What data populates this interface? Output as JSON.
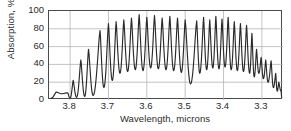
{
  "chart_data": {
    "type": "line",
    "title": "",
    "xlabel": "Wavelength, microns",
    "ylabel": "Absorption, %",
    "xticks": [
      "3.8",
      "3.7",
      "3.6",
      "3.5",
      "3.4",
      "3.3"
    ],
    "xtick_values": [
      3.8,
      3.7,
      3.6,
      3.5,
      3.4,
      3.3
    ],
    "yticks": [
      "0",
      "20",
      "40",
      "60",
      "80",
      "100"
    ],
    "ytick_values": [
      0,
      20,
      40,
      60,
      80,
      100
    ],
    "xlim": [
      3.855,
      3.245
    ],
    "ylim": [
      0,
      100
    ],
    "x_axis_reversed": true,
    "grid": true,
    "grid_color": "#b4b4b4",
    "line_color": "#2a2a2a",
    "frame_color": "#4a4a4a",
    "legend": null,
    "series": [
      {
        "name": "Absorption spectrum",
        "x": [
          3.855,
          3.848,
          3.842,
          3.836,
          3.83,
          3.824,
          3.818,
          3.812,
          3.806,
          3.8,
          3.794,
          3.788,
          3.782,
          3.776,
          3.77,
          3.764,
          3.758,
          3.752,
          3.746,
          3.74,
          3.734,
          3.728,
          3.722,
          3.716,
          3.71,
          3.704,
          3.698,
          3.692,
          3.686,
          3.68,
          3.674,
          3.668,
          3.662,
          3.656,
          3.65,
          3.644,
          3.638,
          3.632,
          3.626,
          3.62,
          3.614,
          3.608,
          3.602,
          3.596,
          3.59,
          3.584,
          3.578,
          3.572,
          3.566,
          3.56,
          3.554,
          3.548,
          3.542,
          3.536,
          3.53,
          3.524,
          3.518,
          3.512,
          3.506,
          3.5,
          3.494,
          3.488,
          3.482,
          3.476,
          3.47,
          3.464,
          3.458,
          3.452,
          3.446,
          3.44,
          3.434,
          3.428,
          3.422,
          3.416,
          3.41,
          3.404,
          3.398,
          3.392,
          3.386,
          3.38,
          3.374,
          3.368,
          3.362,
          3.356,
          3.35,
          3.344,
          3.338,
          3.332,
          3.326,
          3.32,
          3.314,
          3.308,
          3.302,
          3.296,
          3.29,
          3.284,
          3.278,
          3.272,
          3.266,
          3.26,
          3.254,
          3.248
        ],
        "comment": "Dense rovibrational absorption comb; peak envelope rises from ~8% at 3.85, saturates near 90-96% between 3.62 and 3.33, then decays to ~10% by 3.25",
        "peaks": [
          {
            "x": 3.836,
            "y": 9
          },
          {
            "x": 3.82,
            "y": 7
          },
          {
            "x": 3.806,
            "y": 8
          },
          {
            "x": 3.792,
            "y": 22
          },
          {
            "x": 3.772,
            "y": 45
          },
          {
            "x": 3.752,
            "y": 57
          },
          {
            "x": 3.722,
            "y": 78
          },
          {
            "x": 3.7,
            "y": 86
          },
          {
            "x": 3.68,
            "y": 88
          },
          {
            "x": 3.66,
            "y": 90
          },
          {
            "x": 3.64,
            "y": 92
          },
          {
            "x": 3.62,
            "y": 96
          },
          {
            "x": 3.6,
            "y": 93
          },
          {
            "x": 3.58,
            "y": 95
          },
          {
            "x": 3.56,
            "y": 92
          },
          {
            "x": 3.54,
            "y": 94
          },
          {
            "x": 3.52,
            "y": 92
          },
          {
            "x": 3.5,
            "y": 90
          },
          {
            "x": 3.47,
            "y": 89
          },
          {
            "x": 3.452,
            "y": 93
          },
          {
            "x": 3.436,
            "y": 90
          },
          {
            "x": 3.42,
            "y": 94
          },
          {
            "x": 3.404,
            "y": 91
          },
          {
            "x": 3.388,
            "y": 93
          },
          {
            "x": 3.372,
            "y": 88
          },
          {
            "x": 3.356,
            "y": 86
          },
          {
            "x": 3.34,
            "y": 84
          },
          {
            "x": 3.326,
            "y": 75
          },
          {
            "x": 3.314,
            "y": 57
          },
          {
            "x": 3.302,
            "y": 48
          },
          {
            "x": 3.29,
            "y": 45
          },
          {
            "x": 3.276,
            "y": 44
          },
          {
            "x": 3.264,
            "y": 30
          },
          {
            "x": 3.256,
            "y": 20
          },
          {
            "x": 3.25,
            "y": 10
          }
        ],
        "troughs": [
          {
            "x": 3.85,
            "y": 2
          },
          {
            "x": 3.8,
            "y": 2
          },
          {
            "x": 3.783,
            "y": 3
          },
          {
            "x": 3.762,
            "y": 4
          },
          {
            "x": 3.74,
            "y": 5
          },
          {
            "x": 3.712,
            "y": 14
          },
          {
            "x": 3.69,
            "y": 22
          },
          {
            "x": 3.67,
            "y": 30
          },
          {
            "x": 3.65,
            "y": 32
          },
          {
            "x": 3.63,
            "y": 34
          },
          {
            "x": 3.61,
            "y": 33
          },
          {
            "x": 3.59,
            "y": 36
          },
          {
            "x": 3.57,
            "y": 35
          },
          {
            "x": 3.55,
            "y": 34
          },
          {
            "x": 3.53,
            "y": 33
          },
          {
            "x": 3.51,
            "y": 31
          },
          {
            "x": 3.486,
            "y": 18
          },
          {
            "x": 3.462,
            "y": 30
          },
          {
            "x": 3.444,
            "y": 34
          },
          {
            "x": 3.428,
            "y": 36
          },
          {
            "x": 3.412,
            "y": 35
          },
          {
            "x": 3.396,
            "y": 37
          },
          {
            "x": 3.38,
            "y": 34
          },
          {
            "x": 3.364,
            "y": 33
          },
          {
            "x": 3.348,
            "y": 32
          },
          {
            "x": 3.332,
            "y": 30
          },
          {
            "x": 3.32,
            "y": 26
          },
          {
            "x": 3.308,
            "y": 30
          },
          {
            "x": 3.296,
            "y": 24
          },
          {
            "x": 3.284,
            "y": 20
          },
          {
            "x": 3.27,
            "y": 14
          },
          {
            "x": 3.26,
            "y": 10
          },
          {
            "x": 3.248,
            "y": 3
          }
        ]
      }
    ]
  }
}
